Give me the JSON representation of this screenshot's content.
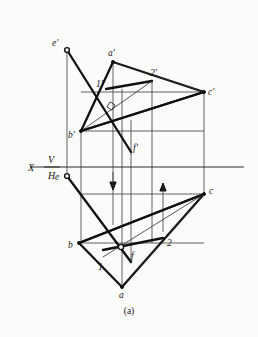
{
  "figure": {
    "caption": "(a)",
    "kind": "descriptive-geometry-projection"
  },
  "axis": {
    "x_label": "X",
    "upper_plane_label": "V",
    "lower_plane_label": "H"
  },
  "labels": {
    "a_prime": "a'",
    "b_prime": "b'",
    "c_prime": "c'",
    "e_prime": "e'",
    "f_prime": "f'",
    "one_prime": "1'",
    "two_prime": "2'",
    "a": "a",
    "b": "b",
    "c": "c",
    "e": "e",
    "f": "f",
    "one": "1",
    "two": "2"
  },
  "points": {
    "a_prime": {
      "x": 113,
      "y": 62
    },
    "b_prime": {
      "x": 81,
      "y": 131
    },
    "c_prime": {
      "x": 204,
      "y": 92
    },
    "e_prime": {
      "x": 67,
      "y": 50
    },
    "f_prime": {
      "x": 131,
      "y": 152
    },
    "one_prime": {
      "x": 106,
      "y": 89
    },
    "two_prime": {
      "x": 152,
      "y": 81
    },
    "a": {
      "x": 122,
      "y": 287
    },
    "b": {
      "x": 79,
      "y": 243
    },
    "c": {
      "x": 204,
      "y": 194
    },
    "e": {
      "x": 67,
      "y": 176
    },
    "f": {
      "x": 123,
      "y": 251
    },
    "one": {
      "x": 103,
      "y": 257
    },
    "two": {
      "x": 163,
      "y": 243
    }
  },
  "colors": {
    "background": "#fbfbfa",
    "ink": "#111111",
    "thin_ink": "#2b2b2b",
    "projection_line": "#3a3a3a"
  },
  "geometry": {
    "axis_y": 167,
    "axis_x_start": 30,
    "axis_x_end": 244,
    "projection_verticals": [
      67,
      81,
      113,
      122,
      131,
      152,
      204
    ],
    "arrow_down_x": 113,
    "arrow_up_x": 163
  }
}
